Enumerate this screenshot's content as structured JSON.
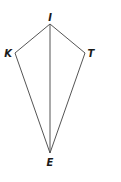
{
  "diagram": {
    "type": "kite",
    "vertices": [
      {
        "name": "I",
        "x": 50,
        "y": 24,
        "label_x": 50,
        "label_y": 21
      },
      {
        "name": "K",
        "x": 15,
        "y": 53,
        "label_x": 8,
        "label_y": 57
      },
      {
        "name": "T",
        "x": 85,
        "y": 53,
        "label_x": 91,
        "label_y": 57
      },
      {
        "name": "E",
        "x": 50,
        "y": 153,
        "label_x": 50,
        "label_y": 166
      }
    ],
    "edges": [
      [
        "I",
        "K"
      ],
      [
        "I",
        "T"
      ],
      [
        "K",
        "E"
      ],
      [
        "T",
        "E"
      ],
      [
        "I",
        "E"
      ]
    ],
    "labels": {
      "I": "I",
      "K": "K",
      "T": "T",
      "E": "E"
    },
    "colors": {
      "edge": "#555555",
      "label": "#1a1a1a",
      "background": "#ffffff"
    }
  }
}
